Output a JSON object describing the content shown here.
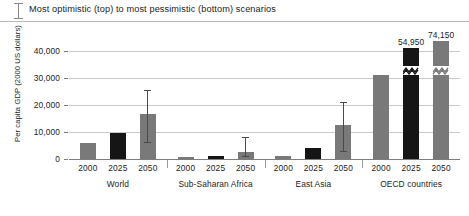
{
  "legend": {
    "icon": "error-bar-icon",
    "text": "Most optimistic (top) to most pessimistic (bottom) scenarios"
  },
  "axis": {
    "ylabel": "Per capita GDP (2000 US dollars)",
    "yticks": [
      "0",
      "10,000",
      "20,000",
      "30,000",
      "40,000"
    ]
  },
  "chart_data": {
    "type": "bar",
    "title": "",
    "subtitle": "Most optimistic (top) to most pessimistic (bottom) scenarios",
    "xlabel": "",
    "ylabel": "Per capita GDP (2000 US dollars)",
    "ylim": [
      0,
      45000
    ],
    "ytick_values": [
      0,
      10000,
      20000,
      30000,
      40000
    ],
    "ytick_labels": [
      "0",
      "10,000",
      "20,000",
      "30,000",
      "40,000"
    ],
    "grid": true,
    "legend_position": "top",
    "groups": [
      "World",
      "Sub-Saharan Africa",
      "East Asia",
      "OECD countries"
    ],
    "categories": [
      "2000",
      "2025",
      "2050"
    ],
    "series_colors": {
      "2000": "#797979",
      "2025": "#151515",
      "2050": "#797979"
    },
    "bars": [
      {
        "group": "World",
        "year": "2000",
        "value": 6000,
        "color": "#797979",
        "label": "",
        "broken": false,
        "error_low": null,
        "error_high": null
      },
      {
        "group": "World",
        "year": "2025",
        "value": 9500,
        "color": "#151515",
        "label": "",
        "broken": false,
        "error_low": null,
        "error_high": null
      },
      {
        "group": "World",
        "year": "2050",
        "value": 16500,
        "color": "#797979",
        "label": "",
        "broken": false,
        "error_low": 6000,
        "error_high": 25500
      },
      {
        "group": "Sub-Saharan Africa",
        "year": "2000",
        "value": 600,
        "color": "#797979",
        "label": "",
        "broken": false,
        "error_low": null,
        "error_high": null
      },
      {
        "group": "Sub-Saharan Africa",
        "year": "2025",
        "value": 1100,
        "color": "#151515",
        "label": "",
        "broken": false,
        "error_low": null,
        "error_high": null
      },
      {
        "group": "Sub-Saharan Africa",
        "year": "2050",
        "value": 2500,
        "color": "#797979",
        "label": "",
        "broken": false,
        "error_low": 700,
        "error_high": 8200
      },
      {
        "group": "East Asia",
        "year": "2000",
        "value": 1300,
        "color": "#797979",
        "label": "",
        "broken": false,
        "error_low": null,
        "error_high": null
      },
      {
        "group": "East Asia",
        "year": "2025",
        "value": 4200,
        "color": "#151515",
        "label": "",
        "broken": false,
        "error_low": null,
        "error_high": null
      },
      {
        "group": "East Asia",
        "year": "2050",
        "value": 12600,
        "color": "#797979",
        "label": "",
        "broken": false,
        "error_low": 2700,
        "error_high": 21000
      },
      {
        "group": "OECD countries",
        "year": "2000",
        "value": 31000,
        "color": "#797979",
        "label": "",
        "broken": false,
        "error_low": null,
        "error_high": null
      },
      {
        "group": "OECD countries",
        "year": "2025",
        "value": 54950,
        "color": "#151515",
        "label": "54,950",
        "broken": true,
        "error_low": null,
        "error_high": null
      },
      {
        "group": "OECD countries",
        "year": "2050",
        "value": 74150,
        "color": "#797979",
        "label": "74,150",
        "broken": true,
        "error_low": null,
        "error_high": null
      }
    ]
  }
}
